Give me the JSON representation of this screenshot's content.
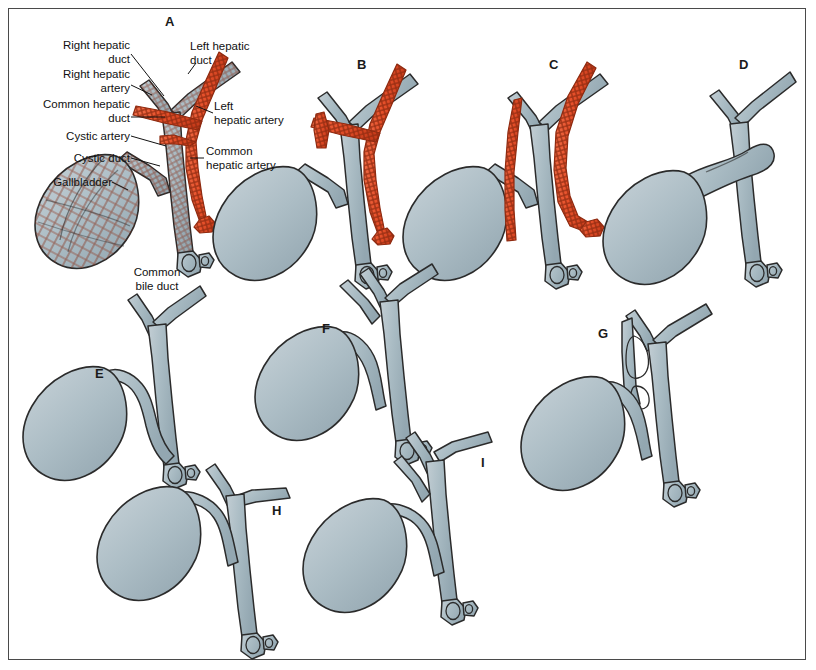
{
  "figure": {
    "panel_count": 9,
    "background_color": "#ffffff",
    "frame_color": "#4a4a4a",
    "colors": {
      "duct_fill": "#a9bcc4",
      "duct_fill_light": "#bccad1",
      "duct_outline": "#2b2b2b",
      "artery_fill": "#e8512b",
      "artery_outline": "#8e2a10",
      "label_text": "#111111",
      "leader_line": "#111111"
    }
  },
  "panels": [
    {
      "id": "A",
      "letter": "A",
      "x": 165,
      "y": 14
    },
    {
      "id": "B",
      "letter": "B",
      "x": 357,
      "y": 57
    },
    {
      "id": "C",
      "letter": "C",
      "x": 549,
      "y": 57
    },
    {
      "id": "D",
      "letter": "D",
      "x": 739,
      "y": 57
    },
    {
      "id": "E",
      "letter": "E",
      "x": 95,
      "y": 366
    },
    {
      "id": "F",
      "letter": "F",
      "x": 322,
      "y": 321
    },
    {
      "id": "G",
      "letter": "G",
      "x": 598,
      "y": 326
    },
    {
      "id": "H",
      "letter": "H",
      "x": 272,
      "y": 503
    },
    {
      "id": "I",
      "letter": "I",
      "x": 481,
      "y": 455
    }
  ],
  "annotations": [
    {
      "name": "right-hepatic-duct",
      "text": "Right hepatic\nduct",
      "align": "right",
      "x": 18,
      "y": 39,
      "width": 112,
      "leader": {
        "x1": 131,
        "y1": 54,
        "x2": 163,
        "y2": 94
      }
    },
    {
      "name": "right-hepatic-artery",
      "text": "Right hepatic\nartery",
      "align": "right",
      "x": 12,
      "y": 68,
      "width": 118,
      "leader": {
        "x1": 131,
        "y1": 84,
        "x2": 152,
        "y2": 93
      }
    },
    {
      "name": "common-hepatic-duct",
      "text": "Common hepatic\nduct",
      "align": "right",
      "x": 3,
      "y": 98,
      "width": 127,
      "leader": {
        "x1": 131,
        "y1": 116,
        "x2": 162,
        "y2": 116
      }
    },
    {
      "name": "cystic-artery",
      "text": "Cystic artery",
      "align": "right",
      "x": 28,
      "y": 130,
      "width": 102,
      "leader": {
        "x1": 131,
        "y1": 135,
        "x2": 163,
        "y2": 143
      }
    },
    {
      "name": "cystic-duct",
      "text": "Cystic duct",
      "align": "right",
      "x": 32,
      "y": 152,
      "width": 98,
      "leader": {
        "x1": 131,
        "y1": 157,
        "x2": 160,
        "y2": 164
      }
    },
    {
      "name": "gallbladder",
      "text": "Gallbladder",
      "align": "right",
      "x": 20,
      "y": 176,
      "width": 92,
      "leader": {
        "x1": 113,
        "y1": 181,
        "x2": 128,
        "y2": 188
      }
    },
    {
      "name": "left-hepatic-duct",
      "text": "Left hepatic\nduct",
      "align": "left",
      "x": 190,
      "y": 40,
      "width": 90,
      "leader": {
        "x1": 193,
        "y1": 62,
        "x2": 186,
        "y2": 72
      }
    },
    {
      "name": "left-hepatic-artery",
      "text": "Left\nhepatic artery",
      "align": "left",
      "x": 214,
      "y": 100,
      "width": 96,
      "leader": {
        "x1": 213,
        "y1": 113,
        "x2": 196,
        "y2": 105
      }
    },
    {
      "name": "common-hepatic-artery",
      "text": "Common\nhepatic artery",
      "align": "left",
      "x": 206,
      "y": 145,
      "width": 96,
      "leader": {
        "x1": 205,
        "y1": 158,
        "x2": 190,
        "y2": 158
      }
    },
    {
      "name": "common-bile-duct",
      "text": "Common\nbile duct",
      "align": "center",
      "x": 118,
      "y": 266,
      "width": 78,
      "leader": null
    }
  ]
}
